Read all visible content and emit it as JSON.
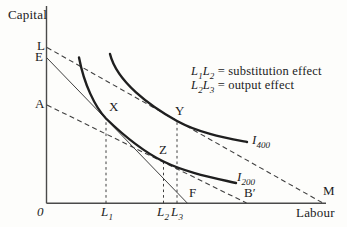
{
  "figure_title": "substitution-and-output-effect-isoquant-diagram",
  "axes": {
    "y_label": "Capital",
    "x_label": "Labour",
    "origin": "0"
  },
  "points": {
    "L": "L",
    "E": "E",
    "A": "A",
    "X": "X",
    "Y": "Y",
    "Z": "Z",
    "F": "F",
    "B_prime": "B′",
    "M": "M"
  },
  "ticks": {
    "l1": {
      "base": "L",
      "sub": "1"
    },
    "l2": {
      "base": "L",
      "sub": "2"
    },
    "l3": {
      "base": "L",
      "sub": "3"
    }
  },
  "isoquants": {
    "i400": {
      "base": "I",
      "sub": "400"
    },
    "i200": {
      "base": "I",
      "sub": "200"
    }
  },
  "legend": {
    "line1": {
      "t1": "L",
      "s1": "1",
      "t2": "L",
      "s2": "2",
      "rest": " = substitution effect"
    },
    "line2": {
      "t1": "L",
      "s1": "2",
      "t2": "L",
      "s2": "3",
      "rest": " = output effect"
    }
  },
  "colors": {
    "ink": "#1f1f1f",
    "axis": "#4a4a4a",
    "background": "#fdfdfb"
  }
}
